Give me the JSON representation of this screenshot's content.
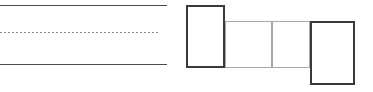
{
  "canvas": {
    "width": 373,
    "height": 92,
    "background": "#ffffff"
  },
  "figure": {
    "type": "technical-line-drawing"
  },
  "colors": {
    "dark_stroke": "#3a3a3a",
    "mid_stroke": "#5a5a5a",
    "light_stroke": "#a8a8a8",
    "dotted_stroke": "#8d8d8d",
    "fill": "#ffffff"
  },
  "left_group": {
    "name": "rail-lines",
    "lines": [
      {
        "name": "upper-rail-line",
        "style": "solid",
        "x1": 0,
        "y1": 5.5,
        "x2": 167,
        "y2": 5.5,
        "width": 1.6,
        "color": "#4a4a4a"
      },
      {
        "name": "center-dotted-line",
        "style": "dotted",
        "x1": 0,
        "y1": 32.5,
        "x2": 160,
        "y2": 32.5,
        "width": 1.1,
        "color": "#8d8d8d",
        "dash": "2 2"
      },
      {
        "name": "lower-rail-line",
        "style": "solid",
        "x1": 0,
        "y1": 64.5,
        "x2": 167,
        "y2": 64.5,
        "width": 1.6,
        "color": "#4a4a4a"
      }
    ]
  },
  "right_group": {
    "name": "block-chain",
    "blocks": [
      {
        "name": "block-left-tall",
        "x": 186,
        "y": 5,
        "width": 39,
        "height": 63,
        "stroke": "#3a3a3a",
        "stroke_width": 1.8,
        "fill": "#ffffff"
      },
      {
        "name": "block-middle-first",
        "x": 225,
        "y": 21,
        "width": 47,
        "height": 47,
        "stroke": "#a8a8a8",
        "stroke_width": 1.4,
        "fill": "#ffffff"
      },
      {
        "name": "block-middle-second",
        "x": 272,
        "y": 21,
        "width": 38,
        "height": 47,
        "stroke": "#a8a8a8",
        "stroke_width": 1.4,
        "fill": "#ffffff"
      },
      {
        "name": "block-right-tall",
        "x": 310,
        "y": 21,
        "width": 45,
        "height": 64,
        "stroke": "#3a3a3a",
        "stroke_width": 1.8,
        "fill": "#ffffff"
      }
    ]
  }
}
